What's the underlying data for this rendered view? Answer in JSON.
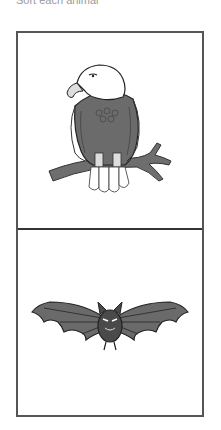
{
  "header": {
    "heading_partial": "Sort each animal",
    "subline_partial": ""
  },
  "grid": {
    "cells": [
      {
        "label": "eagle",
        "icon": "eagle-illustration"
      },
      {
        "label": "bat",
        "icon": "bat-illustration"
      }
    ]
  },
  "colors": {
    "border": "#555555",
    "divider": "#333333",
    "eagle_body": "#6b6b6b",
    "eagle_head": "#ffffff",
    "branch": "#666666",
    "bat_body": "#4a4a4a",
    "bat_wing_membrane": "#7a7a7a"
  }
}
